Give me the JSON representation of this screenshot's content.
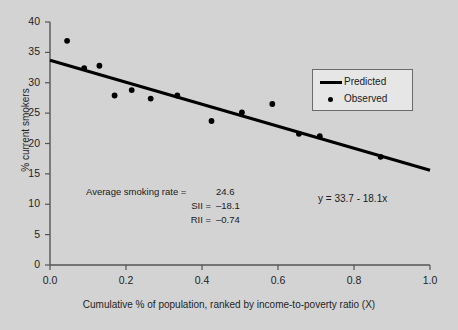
{
  "figure": {
    "background_color": "#d3d3d3",
    "ink_color": "#1f1f1f",
    "line_color": "#000000",
    "marker_color": "#000000",
    "legend_bg_color": "#e6e6e6",
    "legend_border_color": "#6b6b6b"
  },
  "chart_data": {
    "type": "scatter",
    "title": "",
    "subtitle": "",
    "xlabel": "Cumulative % of population, ranked by income-to-poverty ratio (X)",
    "ylabel": "% current smokers",
    "xlim": [
      0.0,
      1.0
    ],
    "ylim": [
      0,
      40
    ],
    "xticks": [
      0.0,
      0.2,
      0.4,
      0.6,
      0.8,
      1.0
    ],
    "xtick_labels": [
      "0.0",
      "0.2",
      "0.4",
      "0.6",
      "0.8",
      "1.0"
    ],
    "yticks": [
      0,
      5,
      10,
      15,
      20,
      25,
      30,
      35,
      40
    ],
    "ytick_labels": [
      "0",
      "5",
      "10",
      "15",
      "20",
      "25",
      "30",
      "35",
      "40"
    ],
    "grid": false,
    "legend_position": "upper right",
    "series": [
      {
        "name": "Predicted",
        "type": "line",
        "marker": "line-swatch",
        "equation": "y = 33.7 - 18.1x",
        "intercept": 33.7,
        "slope": -18.1,
        "x": [
          0.0,
          1.0
        ],
        "values": [
          33.7,
          15.6
        ]
      },
      {
        "name": "Observed",
        "type": "scatter",
        "marker": "dot",
        "x": [
          0.045,
          0.09,
          0.13,
          0.17,
          0.215,
          0.265,
          0.335,
          0.425,
          0.505,
          0.585,
          0.655,
          0.71,
          0.87
        ],
        "values": [
          36.9,
          32.4,
          32.8,
          27.9,
          28.8,
          27.4,
          27.9,
          23.7,
          25.1,
          26.5,
          21.6,
          21.2,
          17.8
        ]
      }
    ],
    "annotations": [
      {
        "label": "Average smoking rate =",
        "value": "24.6"
      },
      {
        "label": "SII  =",
        "value": "–18.1"
      },
      {
        "label": "RII  =",
        "value": "–0.74"
      }
    ],
    "equation_text": "y = 33.7 - 18.1x"
  },
  "legend": {
    "entries": [
      {
        "label": "Predicted",
        "marker": "line-swatch"
      },
      {
        "label": "Observed",
        "marker": "dot-swatch"
      }
    ]
  }
}
